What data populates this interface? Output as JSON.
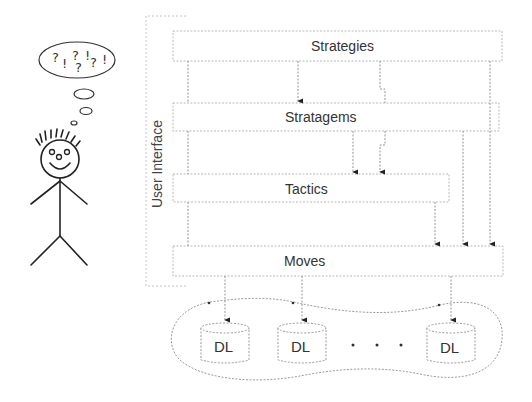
{
  "diagram": {
    "user_interface_label": "User Interface",
    "layers": [
      {
        "id": "strategies",
        "label": "Strategies"
      },
      {
        "id": "stratagems",
        "label": "Stratagems"
      },
      {
        "id": "tactics",
        "label": "Tactics"
      },
      {
        "id": "moves",
        "label": "Moves"
      }
    ],
    "data_layers": [
      {
        "label": "DL"
      },
      {
        "label": "DL"
      },
      {
        "label": "DL"
      }
    ],
    "ellipsis": "· · ·",
    "thought_bubble": {
      "symbols": [
        "?",
        "!",
        "?",
        "!",
        "?",
        "?",
        "!"
      ]
    },
    "figure": "stick-person"
  }
}
